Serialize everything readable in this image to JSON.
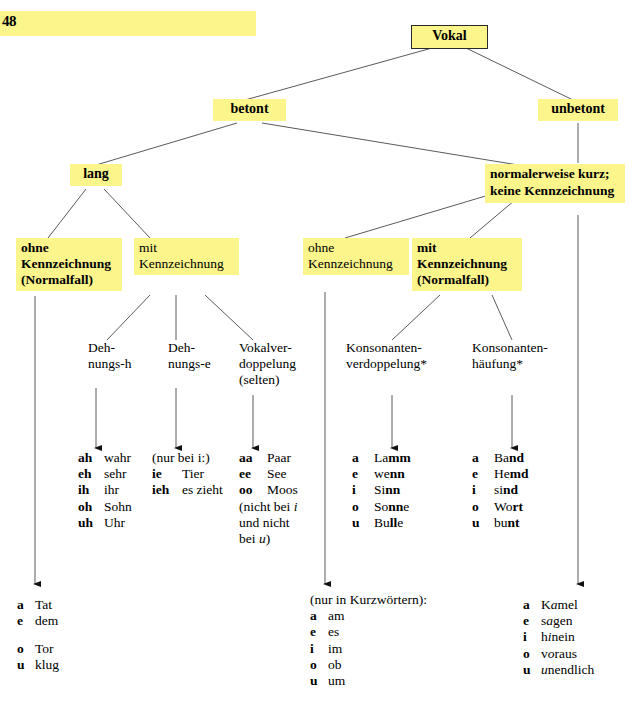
{
  "page": {
    "number": "48"
  },
  "tree": {
    "root": {
      "label": "Vokal"
    },
    "level2": [
      {
        "label": "betont"
      },
      {
        "label": "unbetont"
      }
    ],
    "level3": [
      {
        "label": "lang"
      },
      {
        "label": "kurz"
      },
      {
        "label": "normalerweise kurz;\nkeine Kennzeichnung"
      }
    ],
    "level4": [
      {
        "label": "ohne\nKennzeichnung\n(Normalfall)",
        "emphasis": "bold"
      },
      {
        "label": "mit\nKennzeichnung",
        "emphasis": "normal"
      },
      {
        "label": "ohne\nKennzeichnung",
        "emphasis": "normal"
      },
      {
        "label": "mit\nKennzeichnung\n(Normalfall)",
        "emphasis": "bold"
      }
    ],
    "level5": [
      {
        "label": "Deh-\nnungs-h"
      },
      {
        "label": "Deh-\nnungs-e"
      },
      {
        "label": "Vokalver-\ndoppelung\n(selten)"
      },
      {
        "label": "Konsonanten-\nverdoppelung*"
      },
      {
        "label": "Konsonanten-\nhäufung*"
      }
    ]
  },
  "examples": {
    "dehnungs_h": {
      "rows": [
        {
          "key": "ah",
          "word": "wahr"
        },
        {
          "key": "eh",
          "word": "sehr"
        },
        {
          "key": "ih",
          "word": "ihr"
        },
        {
          "key": "oh",
          "word": "Sohn"
        },
        {
          "key": "uh",
          "word": "Uhr"
        }
      ]
    },
    "dehnungs_e": {
      "header": "(nur bei i:)",
      "rows": [
        {
          "key": "ie",
          "word": "Tier"
        },
        {
          "key": "ieh",
          "word": "es zieht"
        }
      ]
    },
    "vokalverdoppelung": {
      "rows": [
        {
          "key": "aa",
          "word": "Paar"
        },
        {
          "key": "ee",
          "word": "See"
        },
        {
          "key": "oo",
          "word": "Moos"
        }
      ],
      "note": "(nicht bei i\nund nicht\nbei u)"
    },
    "konsonantenverdoppelung": {
      "rows": [
        {
          "key": "a",
          "word": "Lamm"
        },
        {
          "key": "e",
          "word": "wenn"
        },
        {
          "key": "i",
          "word": "Sinn"
        },
        {
          "key": "o",
          "word": "Sonne"
        },
        {
          "key": "u",
          "word": "Bulle"
        }
      ]
    },
    "konsonantenhaeufung": {
      "rows": [
        {
          "key": "a",
          "word": "Band"
        },
        {
          "key": "e",
          "word": "Hemd"
        },
        {
          "key": "i",
          "word": "sind"
        },
        {
          "key": "o",
          "word": "Wort"
        },
        {
          "key": "u",
          "word": "bunt"
        }
      ]
    },
    "lang_ohne_kennzeichnung": {
      "rows": [
        {
          "key": "a",
          "word": "Tat"
        },
        {
          "key": "e",
          "word": "dem"
        },
        {
          "key": "",
          "word": ""
        },
        {
          "key": "o",
          "word": "Tor"
        },
        {
          "key": "u",
          "word": "klug"
        }
      ]
    },
    "kurz_ohne_kennzeichnung": {
      "header": "(nur in Kurzwörtern):",
      "rows": [
        {
          "key": "a",
          "word": "am"
        },
        {
          "key": "e",
          "word": "es"
        },
        {
          "key": "i",
          "word": "im"
        },
        {
          "key": "o",
          "word": "ob"
        },
        {
          "key": "u",
          "word": "um"
        }
      ]
    },
    "unbetont": {
      "rows": [
        {
          "key": "a",
          "word": "Kamel"
        },
        {
          "key": "e",
          "word": "sagen"
        },
        {
          "key": "i",
          "word": "hinein"
        },
        {
          "key": "o",
          "word": "voraus"
        },
        {
          "key": "u",
          "word": "unendlich"
        }
      ]
    }
  },
  "colors": {
    "highlight": "#fbf58c",
    "line": "#5a5a5a",
    "text": "#000000"
  }
}
